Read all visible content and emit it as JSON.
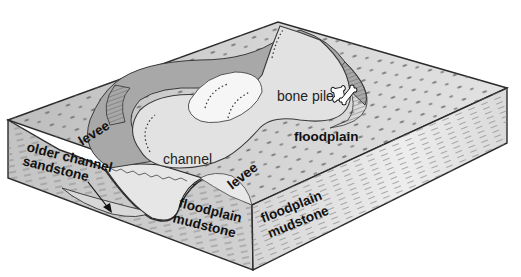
{
  "figure": {
    "type": "block diagram"
  },
  "labels": {
    "levee_left": "levee",
    "levee_right": "levee",
    "channel": "channel",
    "bone_pile": "bone pile",
    "floodplain": "floodplain",
    "older_channel_line1": "older channel",
    "older_channel_line2": "sandstone",
    "mudstone_front_line1": "floodplain",
    "mudstone_front_line2": "mudstone",
    "mudstone_right_line1": "floodplain",
    "mudstone_right_line2": "mudstone"
  },
  "icons": {
    "bone_pile": "bones-icon",
    "pointer": "arrow-icon"
  },
  "colors": {
    "background": "#ffffff",
    "outline": "#2a2a2a",
    "floodplain_surface": "#c9c9c9",
    "levee_surface": "#a9a9a9",
    "channel_fill": "#e3e3e3",
    "point_bar": "#f4f4f4",
    "cut_bank": "#8c8c8c",
    "block_face": "#cfcfcf",
    "mudstone_dash": "#7a7a7a"
  }
}
